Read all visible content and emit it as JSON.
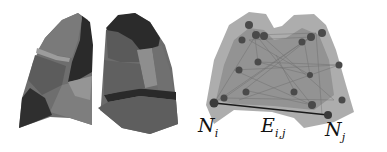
{
  "figure": {
    "left_panel": {
      "description": "Segmented lung lobes (3D render)",
      "lungs": [
        "left-lung",
        "right-lung"
      ]
    },
    "right_panel": {
      "description": "Graph over lung regions with nodes and edges",
      "labels": {
        "node_i": {
          "base": "N",
          "sub": "i"
        },
        "edge": {
          "base": "E",
          "sub": "i,j"
        },
        "node_j": {
          "base": "N",
          "sub": "j"
        }
      },
      "colors": {
        "lung_fill": "#9a9a9a",
        "node": "#4a4a4a",
        "edge_highlight": "#1a1a1a"
      }
    }
  }
}
